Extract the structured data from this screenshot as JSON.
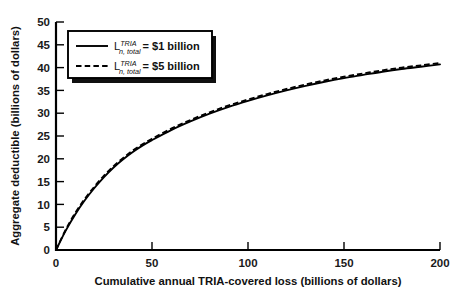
{
  "chart_data": {
    "type": "line",
    "title": "",
    "xlabel": "Cumulative annual TRIA-covered loss (billions of dollars)",
    "ylabel": "Aggregate deductible (billions of dollars)",
    "xlim": [
      0,
      200
    ],
    "ylim": [
      0,
      50
    ],
    "xticks": [
      "0",
      "50",
      "100",
      "150",
      "200"
    ],
    "yticks": [
      "0",
      "5",
      "10",
      "15",
      "20",
      "25",
      "30",
      "35",
      "40",
      "45",
      "50"
    ],
    "grid": false,
    "legend_position": "upper-left",
    "x": [
      0,
      5,
      10,
      15,
      20,
      25,
      30,
      35,
      40,
      45,
      50,
      60,
      70,
      80,
      90,
      100,
      110,
      120,
      130,
      140,
      150,
      160,
      170,
      180,
      190,
      200
    ],
    "series": [
      {
        "name": "solid",
        "label_symbol": "L",
        "label_sup": "TRIA",
        "label_sub": "n, total",
        "label_value": "= $1 billion",
        "style": "solid",
        "values": [
          0,
          4.2,
          7.8,
          10.9,
          13.6,
          16.0,
          18.1,
          19.9,
          21.5,
          22.9,
          24.1,
          26.3,
          28.2,
          29.9,
          31.4,
          32.7,
          33.9,
          35.0,
          36.0,
          36.9,
          37.7,
          38.4,
          39.1,
          39.7,
          40.2,
          40.7
        ]
      },
      {
        "name": "dashed",
        "label_symbol": "L",
        "label_sup": "TRIA",
        "label_sub": "n, total",
        "label_value": "= $5 billion",
        "style": "dashed",
        "values": [
          0,
          4.4,
          8.1,
          11.2,
          13.9,
          16.3,
          18.4,
          20.2,
          21.8,
          23.2,
          24.4,
          26.6,
          28.5,
          30.2,
          31.7,
          33.0,
          34.2,
          35.3,
          36.3,
          37.2,
          38.0,
          38.7,
          39.4,
          40.0,
          40.5,
          41.0
        ]
      }
    ]
  },
  "legend": {
    "entries": [
      {
        "symbol": "L",
        "sup": "TRIA",
        "sub": "n, total",
        "value": "= $1 billion",
        "style": "solid"
      },
      {
        "symbol": "L",
        "sup": "TRIA",
        "sub": "n, total",
        "value": "= $5 billion",
        "style": "dashed"
      }
    ]
  },
  "colors": {
    "line": "#000000",
    "background": "#ffffff",
    "text": "#111111",
    "legend_shadow": "#101010"
  }
}
